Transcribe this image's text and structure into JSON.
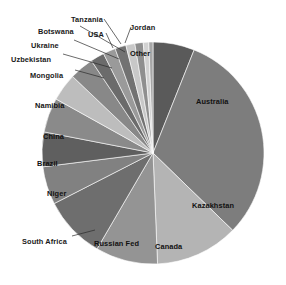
{
  "chart_data": {
    "type": "pie",
    "title": "",
    "subtitle": "",
    "xlabel": "",
    "ylabel": "",
    "legend_position": "none",
    "grid": false,
    "start_angle_deg": 0,
    "direction": "clockwise",
    "categories": [
      "Other",
      "Australia",
      "Kazakhstan",
      "Canada",
      "Russian Fed",
      "South Africa",
      "Niger",
      "Brazil",
      "China",
      "Namibia",
      "Mongolia",
      "Uzbekistan",
      "Ukraine",
      "Botswana",
      "USA",
      "Tanzania",
      "Jordan"
    ],
    "values": [
      6.0,
      31.0,
      12.0,
      9.0,
      9.0,
      5.5,
      5.0,
      5.0,
      4.0,
      3.5,
      2.0,
      1.8,
      1.6,
      1.3,
      1.2,
      0.8,
      0.6
    ],
    "slices": [
      {
        "label": "Other",
        "value": 6.0,
        "color": "#5a5a5a",
        "label_placement": "inside",
        "label_x": 130,
        "label_y": 50
      },
      {
        "label": "Australia",
        "value": 31.0,
        "color": "#7d7d7d",
        "label_placement": "inside",
        "label_x": 196,
        "label_y": 98
      },
      {
        "label": "Kazakhstan",
        "value": 12.0,
        "color": "#b4b4b4",
        "label_placement": "inside",
        "label_x": 192,
        "label_y": 202
      },
      {
        "label": "Canada",
        "value": 9.0,
        "color": "#949494",
        "label_placement": "inside",
        "label_x": 155,
        "label_y": 243
      },
      {
        "label": "Russian Fed",
        "value": 9.0,
        "color": "#6e6e6e",
        "label_placement": "inside",
        "label_x": 94,
        "label_y": 240
      },
      {
        "label": "South Africa",
        "value": 5.5,
        "color": "#818181",
        "label_placement": "outside",
        "label_x": 22,
        "label_y": 238
      },
      {
        "label": "Niger",
        "value": 5.0,
        "color": "#5f5f5f",
        "label_placement": "inside",
        "label_x": 47,
        "label_y": 190
      },
      {
        "label": "Brazil",
        "value": 5.0,
        "color": "#8a8a8a",
        "label_placement": "inside",
        "label_x": 37,
        "label_y": 160
      },
      {
        "label": "China",
        "value": 4.0,
        "color": "#bdbdbd",
        "label_placement": "inside",
        "label_x": 43,
        "label_y": 133
      },
      {
        "label": "Namibia",
        "value": 3.5,
        "color": "#888888",
        "label_placement": "inside",
        "label_x": 35,
        "label_y": 102
      },
      {
        "label": "Mongolia",
        "value": 2.0,
        "color": "#6b6b6b",
        "label_placement": "outside",
        "label_x": 30,
        "label_y": 72
      },
      {
        "label": "Uzbekistan",
        "value": 1.8,
        "color": "#9a9a9a",
        "label_placement": "outside",
        "label_x": 11,
        "label_y": 56
      },
      {
        "label": "Ukraine",
        "value": 1.6,
        "color": "#727272",
        "label_placement": "outside",
        "label_x": 31,
        "label_y": 42
      },
      {
        "label": "Botswana",
        "value": 1.3,
        "color": "#c8c8c8",
        "label_placement": "outside",
        "label_x": 38,
        "label_y": 28
      },
      {
        "label": "USA",
        "value": 1.2,
        "color": "#8f8f8f",
        "label_placement": "outside",
        "label_x": 88,
        "label_y": 31
      },
      {
        "label": "Tanzania",
        "value": 0.8,
        "color": "#d2d2d2",
        "label_placement": "outside",
        "label_x": 71,
        "label_y": 16
      },
      {
        "label": "Jordan",
        "value": 0.6,
        "color": "#a6a6a6",
        "label_placement": "outside",
        "label_x": 130,
        "label_y": 24
      }
    ],
    "geometry": {
      "center_x": 153,
      "center_y": 153,
      "radius": 111
    },
    "leader_lines": [
      {
        "label": "South Africa",
        "x1": 72,
        "y1": 236,
        "x2": 95,
        "y2": 230
      },
      {
        "label": "Mongolia",
        "x1": 75,
        "y1": 70,
        "x2": 104,
        "y2": 78
      },
      {
        "label": "Uzbekistan",
        "x1": 63,
        "y1": 54,
        "x2": 112,
        "y2": 68
      },
      {
        "label": "Ukraine",
        "x1": 74,
        "y1": 40,
        "x2": 119,
        "y2": 59
      },
      {
        "label": "Botswana",
        "x1": 80,
        "y1": 26,
        "x2": 125,
        "y2": 52
      },
      {
        "label": "USA",
        "x1": 106,
        "y1": 33,
        "x2": 113,
        "y2": 48
      },
      {
        "label": "Tanzania",
        "x1": 104,
        "y1": 19,
        "x2": 121,
        "y2": 44
      },
      {
        "label": "Jordan",
        "x1": 131,
        "y1": 27,
        "x2": 125,
        "y2": 43
      }
    ]
  }
}
